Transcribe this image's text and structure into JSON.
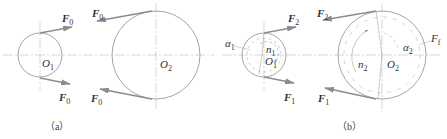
{
  "figure": {
    "colors": {
      "line": "#9a9a9a",
      "centerline": "#b8b8b8",
      "text": "#333333",
      "arrow": "#8c8c8c"
    },
    "panel_a": {
      "caption": "（a）",
      "small_pulley_center": "O",
      "small_pulley_center_sub": "1",
      "large_pulley_center": "O",
      "large_pulley_center_sub": "2",
      "force_labels": [
        {
          "base": "F",
          "sub": "0",
          "position": "small-top"
        },
        {
          "base": "F",
          "sub": "0",
          "position": "small-bottom"
        },
        {
          "base": "F",
          "sub": "0",
          "position": "large-top"
        },
        {
          "base": "F",
          "sub": "0",
          "position": "large-bottom"
        }
      ]
    },
    "panel_b": {
      "caption": "（b）",
      "small_pulley_center": "O",
      "small_pulley_center_sub": "1",
      "large_pulley_center": "O",
      "large_pulley_center_sub": "2",
      "wrap_angle_small": "α",
      "wrap_angle_small_sub": "1",
      "wrap_angle_large": "α",
      "wrap_angle_large_sub": "2",
      "speed_small": "n",
      "speed_small_sub": "1",
      "speed_large": "n",
      "speed_large_sub": "2",
      "friction_force": "F",
      "friction_force_sub": "f",
      "force_labels": [
        {
          "base": "F",
          "sub": "2",
          "position": "small-top"
        },
        {
          "base": "F",
          "sub": "1",
          "position": "small-bottom"
        },
        {
          "base": "F",
          "sub": "2",
          "position": "large-top"
        },
        {
          "base": "F",
          "sub": "1",
          "position": "large-bottom"
        }
      ]
    }
  }
}
